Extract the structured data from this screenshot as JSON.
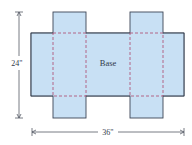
{
  "diagram": {
    "colors": {
      "fill": "#c8e0f4",
      "outline": "#3d4556",
      "fold_line": "#b0587a",
      "dimension": "#555a66",
      "text": "#333a4a"
    },
    "base_label": "Base",
    "dimensions": {
      "height_label": "24\"",
      "width_label": "36\""
    },
    "shapes": {
      "main_rect": {
        "x": 31,
        "y": 33,
        "w": 153,
        "h": 63
      },
      "left_flap": {
        "x": 53,
        "y": 12,
        "w": 33,
        "h": 106
      },
      "right_flap": {
        "x": 130,
        "y": 12,
        "w": 33,
        "h": 106
      },
      "left_fold": {
        "x": 53,
        "y": 33,
        "w": 33,
        "h": 63
      },
      "right_fold": {
        "x": 130,
        "y": 33,
        "w": 33,
        "h": 63
      }
    }
  }
}
